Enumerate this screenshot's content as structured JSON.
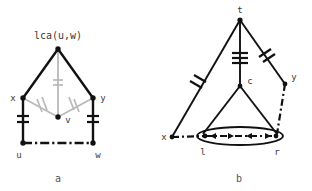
{
  "figure": {
    "title_text": "lca(u,w)",
    "panels": [
      {
        "id": "a",
        "caption": "a",
        "nodes": [
          {
            "name": "lca",
            "label": "lca(u,w)",
            "x": 58,
            "y": 49
          },
          {
            "name": "x",
            "label": "x",
            "x": 23,
            "y": 98
          },
          {
            "name": "y",
            "label": "y",
            "x": 93,
            "y": 98
          },
          {
            "name": "v",
            "label": "v",
            "x": 58,
            "y": 117
          },
          {
            "name": "u",
            "label": "u",
            "x": 23,
            "y": 143
          },
          {
            "name": "w",
            "label": "w",
            "x": 93,
            "y": 143
          }
        ],
        "edges": [
          {
            "from": "lca",
            "to": "x",
            "style": "solid-dark",
            "ticks": 0
          },
          {
            "from": "lca",
            "to": "y",
            "style": "solid-dark",
            "ticks": 0
          },
          {
            "from": "lca",
            "to": "v",
            "style": "gray",
            "ticks": 2
          },
          {
            "from": "x",
            "to": "v",
            "style": "gray",
            "ticks": 2
          },
          {
            "from": "y",
            "to": "v",
            "style": "gray",
            "ticks": 2
          },
          {
            "from": "x",
            "to": "u",
            "style": "solid-dark",
            "ticks": 2
          },
          {
            "from": "y",
            "to": "w",
            "style": "solid-dark",
            "ticks": 2
          },
          {
            "from": "u",
            "to": "w",
            "style": "dash-dot",
            "ticks": 0
          }
        ]
      },
      {
        "id": "b",
        "caption": "b",
        "nodes": [
          {
            "name": "t",
            "label": "t",
            "x": 240,
            "y": 20
          },
          {
            "name": "c",
            "label": "c",
            "x": 240,
            "y": 86
          },
          {
            "name": "y",
            "label": "y",
            "x": 285,
            "y": 84
          },
          {
            "name": "x",
            "label": "x",
            "x": 172,
            "y": 137
          },
          {
            "name": "l",
            "label": "l",
            "x": 205,
            "y": 137
          },
          {
            "name": "r",
            "label": "r",
            "x": 276,
            "y": 137
          }
        ],
        "edges": [
          {
            "from": "t",
            "to": "x",
            "style": "solid-dark",
            "ticks": 2
          },
          {
            "from": "t",
            "to": "c",
            "style": "solid-dark",
            "ticks": 3
          },
          {
            "from": "t",
            "to": "y",
            "style": "solid-dark",
            "ticks": 2
          },
          {
            "from": "c",
            "to": "l",
            "style": "solid-dark",
            "ticks": 0
          },
          {
            "from": "c",
            "to": "r",
            "style": "solid-dark",
            "ticks": 0
          },
          {
            "from": "y",
            "to": "r",
            "style": "dash-dot",
            "ticks": 0
          },
          {
            "from": "x",
            "to": "l",
            "style": "dash-dot",
            "ticks": 0
          },
          {
            "from": "l",
            "to": "r",
            "style": "dash-dot-arrows",
            "ticks": 0
          }
        ],
        "ellipse": {
          "cx": 240,
          "cy": 136,
          "rx": 43,
          "ry": 9
        }
      }
    ]
  },
  "colors": {
    "ink": "#111111",
    "gray_edge": "#b9b9b9",
    "label": "#3a3a3a",
    "caption": "#555555",
    "background": "#ffffff"
  }
}
